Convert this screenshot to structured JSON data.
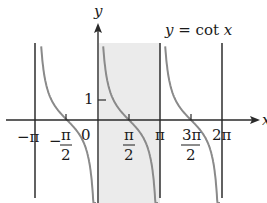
{
  "chart_data": {
    "type": "line",
    "title": "y = cot x",
    "function": "cot x",
    "xlabel": "x",
    "ylabel": "y",
    "x_ticks": [
      "-π",
      "-π/2",
      "0",
      "π/2",
      "π",
      "3π/2",
      "2π"
    ],
    "y_ticks": [
      "1"
    ],
    "asymptotes": [
      "-π",
      "0",
      "π",
      "2π"
    ],
    "shaded_interval": [
      "0",
      "π"
    ],
    "xlim": [
      -3.5,
      7.5
    ],
    "grid": false,
    "legend": null,
    "colors": {
      "curve": "#8a8a8a",
      "axis": "#2a2a2a",
      "asymptote": "#3a3a3a",
      "shade": "#e8e8e8"
    }
  },
  "labels": {
    "title": "y = cot x",
    "x_axis": "x",
    "y_axis": "y",
    "tick_neg_pi": "−π",
    "tick_neg_half_pi_num": "π",
    "tick_neg_half_pi_den": "2",
    "tick_neg_half_pi_sign": "−",
    "tick_zero": "0",
    "tick_half_pi_num": "π",
    "tick_half_pi_den": "2",
    "tick_pi": "π",
    "tick_3half_pi_num": "3π",
    "tick_3half_pi_den": "2",
    "tick_2pi": "2π",
    "y_tick_1": "1"
  }
}
